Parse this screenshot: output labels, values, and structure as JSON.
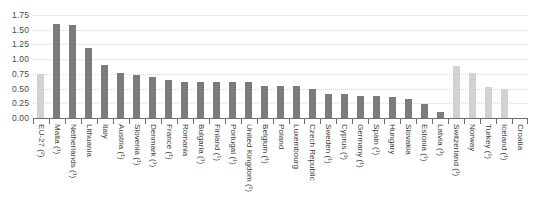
{
  "chart_data": {
    "type": "bar",
    "title": "",
    "subtitle": "",
    "xlabel": "",
    "ylabel": "",
    "ylim": [
      0.0,
      1.75
    ],
    "grid": true,
    "legend": false,
    "ytick_labels": [
      "1.75",
      "1.50",
      "1.25",
      "1.00",
      "0.75",
      "0.50",
      "0.25",
      "0.00"
    ],
    "ytick_values": [
      1.75,
      1.5,
      1.25,
      1.0,
      0.75,
      0.5,
      0.25,
      0.0
    ],
    "categories": [
      "EU-27 (²)",
      "Malta (¹)",
      "Netherlands (¹)",
      "Lithuania",
      "Italy",
      "Austria (¹)",
      "Slovenia (¹)",
      "Denmark (¹)",
      "France (¹)",
      "Romania",
      "Bulgaria (¹)",
      "Finland (¹)",
      "Portugal (¹)",
      "United Kingdom (¹)",
      "Belgium (¹)",
      "Poland",
      "Luxembourg",
      "Czech Republic",
      "Sweden (¹)",
      "Cyprus (¹)",
      "Germany (¹)",
      "Spain (¹)",
      "Hungary",
      "Slovakia",
      "Estonia (¹)",
      "Latvia (¹)",
      "Switzerland (¹)",
      "Norway",
      "Turkey (¹)",
      "Iceland (¹)",
      "Croatia"
    ],
    "values": [
      0.75,
      1.59,
      1.58,
      1.19,
      0.9,
      0.76,
      0.73,
      0.69,
      0.64,
      0.62,
      0.62,
      0.62,
      0.62,
      0.62,
      0.55,
      0.54,
      0.54,
      0.49,
      0.41,
      0.4,
      0.38,
      0.37,
      0.35,
      0.32,
      0.23,
      0.1,
      0.88,
      0.76,
      0.52,
      0.49,
      0.0
    ],
    "series": [
      {
        "name": "Value",
        "values": [
          0.75,
          1.59,
          1.58,
          1.19,
          0.9,
          0.76,
          0.73,
          0.69,
          0.64,
          0.62,
          0.62,
          0.62,
          0.62,
          0.62,
          0.55,
          0.54,
          0.54,
          0.49,
          0.41,
          0.4,
          0.38,
          0.37,
          0.35,
          0.32,
          0.23,
          0.1,
          0.88,
          0.76,
          0.52,
          0.49,
          0.0
        ]
      }
    ],
    "bar_styles": [
      "light",
      "dark",
      "dark",
      "dark",
      "dark",
      "dark",
      "dark",
      "dark",
      "dark",
      "dark",
      "dark",
      "dark",
      "dark",
      "dark",
      "dark",
      "dark",
      "dark",
      "dark",
      "dark",
      "dark",
      "dark",
      "dark",
      "dark",
      "dark",
      "dark",
      "dark",
      "light",
      "light",
      "light",
      "light",
      "empty"
    ],
    "colors": {
      "bar_dark": "#7b7b7b",
      "bar_light": "#d2d2d2",
      "gridline": "#d8d8dc",
      "axis": "#6e6e6e",
      "tick_text": "#4a4a4a",
      "label_text": "#3c3c3c",
      "background": "#ffffff"
    }
  }
}
